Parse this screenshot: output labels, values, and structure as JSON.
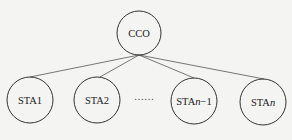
{
  "diagram": {
    "type": "tree",
    "root": {
      "id": "cco",
      "label": "CCO",
      "cx": 139,
      "cy": 33,
      "r": 22
    },
    "children": [
      {
        "id": "sta1",
        "label_main": "STA1",
        "label_italic": "",
        "label_suffix": "",
        "cx": 30,
        "cy": 100,
        "r": 23
      },
      {
        "id": "sta2",
        "label_main": "STA2",
        "label_italic": "",
        "label_suffix": "",
        "cx": 97,
        "cy": 100,
        "r": 23
      },
      {
        "id": "sta-n-minus-1",
        "label_main": "STA",
        "label_italic": "n",
        "label_suffix": "−1",
        "cx": 194,
        "cy": 101,
        "r": 23
      },
      {
        "id": "sta-n",
        "label_main": "STA",
        "label_italic": "n",
        "label_suffix": "",
        "cx": 263,
        "cy": 102,
        "r": 23
      }
    ],
    "ellipsis": {
      "text": "……",
      "x": 144,
      "y": 101
    },
    "colors": {
      "background": "#f4f4f2",
      "stroke": "#333333",
      "text": "#222222"
    }
  }
}
